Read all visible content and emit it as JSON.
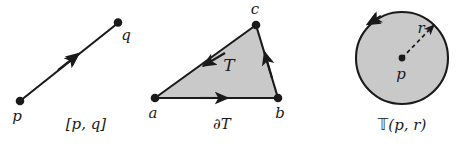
{
  "figure": {
    "background_color": "#ffffff",
    "stroke_color": "#1a1a1a",
    "fill_gray": "#c9c9c9",
    "panels": [
      {
        "id": "segment",
        "caption": "[p, q]",
        "point_labels": [
          "p",
          "q"
        ],
        "orientation": "p-to-q"
      },
      {
        "id": "triangle",
        "caption": "∂T",
        "interior_label": "T",
        "point_labels": [
          "a",
          "b",
          "c"
        ],
        "orientation": "counterclockwise a-to-b-to-c"
      },
      {
        "id": "disk",
        "caption_prefix": "𝕋",
        "caption_suffix": "(p, r)",
        "center_label": "p",
        "radius_label": "r",
        "orientation": "counterclockwise"
      }
    ]
  },
  "segment_panel": {
    "caption": "[p, q]",
    "label_p": "p",
    "label_q": "q"
  },
  "triangle_panel": {
    "caption": "∂T",
    "label_a": "a",
    "label_b": "b",
    "label_c": "c",
    "label_T": "T"
  },
  "disk_panel": {
    "caption_T": "𝕋",
    "caption_args": "(p, r)",
    "label_p": "p",
    "label_r": "r"
  }
}
